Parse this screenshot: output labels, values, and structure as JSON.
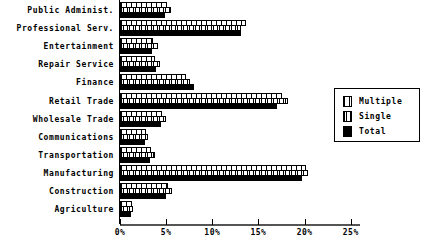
{
  "chart_data": {
    "type": "bar",
    "orientation": "horizontal",
    "title": "",
    "xlabel": "",
    "ylabel": "",
    "xlim": [
      0,
      26
    ],
    "xticks": [
      "0%",
      "5%",
      "10%",
      "15%",
      "20%",
      "25%"
    ],
    "xtick_values": [
      0,
      5,
      10,
      15,
      20,
      25
    ],
    "grid": false,
    "legend_position": "right",
    "categories": [
      "Public Administ.",
      "Professional Serv.",
      "Entertainment",
      "Repair Service",
      "Finance",
      "Retail Trade",
      "Wholesale Trade",
      "Communications",
      "Transportation",
      "Manufacturing",
      "Construction",
      "Agriculture"
    ],
    "series": [
      {
        "name": "Multiple",
        "values": [
          5.1,
          13.6,
          3.6,
          3.8,
          7.1,
          17.6,
          4.6,
          2.8,
          3.4,
          20.2,
          5.2,
          1.3
        ]
      },
      {
        "name": "Single",
        "values": [
          5.5,
          13.1,
          4.1,
          4.3,
          7.6,
          18.2,
          5.0,
          3.0,
          3.8,
          20.4,
          5.6,
          1.4
        ]
      },
      {
        "name": "Total",
        "values": [
          4.9,
          13.1,
          3.5,
          3.9,
          8.0,
          17.0,
          4.4,
          2.7,
          3.3,
          19.7,
          5.0,
          1.2
        ]
      }
    ]
  },
  "legend": {
    "entries": [
      {
        "label": "Multiple",
        "pattern": "vertical-stripe-wide"
      },
      {
        "label": "Single",
        "pattern": "vertical-stripe-narrow"
      },
      {
        "label": "Total",
        "pattern": "solid-black"
      }
    ]
  }
}
